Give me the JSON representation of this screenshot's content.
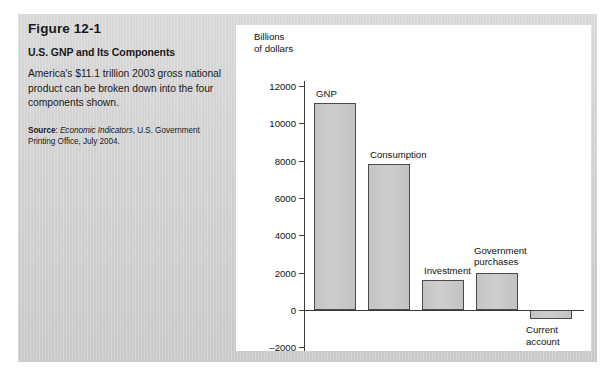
{
  "figure": {
    "number": "Figure 12-1",
    "title": "U.S. GNP and Its Components",
    "description": "America's $11.1 trillion 2003 gross national product can be broken down into the four components shown.",
    "source_label": "Source",
    "source_italic": "Economic Indicators",
    "source_rest": ", U.S. Government Printing Office, July 2004."
  },
  "chart_data": {
    "type": "bar",
    "title": "",
    "axis_title": "Billions\nof dollars",
    "xlabel": "",
    "ylabel": "Billions of dollars",
    "categories": [
      "GNP",
      "Consumption",
      "Investment",
      "Government purchases",
      "Current account"
    ],
    "values": [
      11100,
      7800,
      1600,
      2000,
      -500
    ],
    "ylim": [
      -2000,
      12000
    ],
    "yticks": [
      12000,
      10000,
      8000,
      6000,
      4000,
      2000,
      0,
      -2000
    ],
    "ytick_labels": [
      "12000",
      "10000",
      "8000",
      "6000",
      "4000",
      "2000",
      "0",
      "–2000"
    ],
    "grid": false,
    "legend": "none",
    "bar_color": "#c8c8c8",
    "bar_edge_color": "#4a4a4a",
    "axis_color": "#3a3a3a",
    "label_positions": [
      "above",
      "above",
      "above",
      "above",
      "below"
    ],
    "labels": {
      "gnp": "GNP",
      "consumption": "Consumption",
      "investment": "Investment",
      "government_purchases": "Government\npurchases",
      "current_account": "Current\naccount"
    }
  }
}
